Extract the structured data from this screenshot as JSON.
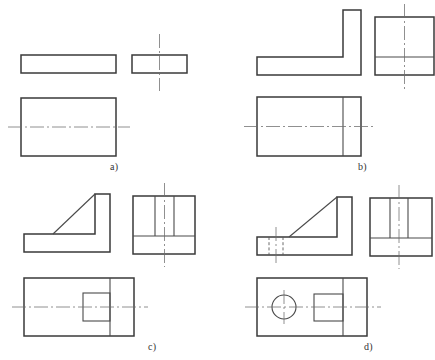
{
  "document": {
    "type": "engineering-drawing",
    "description": "Orthographic projection exercise sheet with four parts",
    "background_color": "#ffffff",
    "line_color": "#3a3a3a",
    "center_line_color": "#6b6b6b",
    "hidden_line_color": "#5a5a5a"
  },
  "figures": [
    {
      "id": "a",
      "label": "a)",
      "title": "Flat rectangular plate",
      "views": [
        {
          "name": "front-view",
          "shape": "rectangle",
          "features": [
            "outline"
          ],
          "center_lines": []
        },
        {
          "name": "side-view",
          "shape": "rectangle",
          "features": [
            "outline"
          ],
          "center_lines": [
            "vertical"
          ]
        },
        {
          "name": "top-view",
          "shape": "rectangle",
          "features": [
            "outline"
          ],
          "center_lines": [
            "horizontal"
          ]
        }
      ]
    },
    {
      "id": "b",
      "label": "b)",
      "title": "L-shaped angle bracket",
      "views": [
        {
          "name": "front-view",
          "shape": "L-profile",
          "features": [
            "outline",
            "vertical-wall-right",
            "horizontal-base"
          ],
          "center_lines": []
        },
        {
          "name": "side-view",
          "shape": "square",
          "features": [
            "outline",
            "horizontal-division-line"
          ],
          "center_lines": [
            "vertical"
          ]
        },
        {
          "name": "top-view",
          "shape": "rectangle",
          "features": [
            "outline",
            "vertical-division-line"
          ],
          "center_lines": [
            "horizontal"
          ]
        }
      ]
    },
    {
      "id": "c",
      "label": "c)",
      "title": "L-bracket with triangular gusset rib",
      "views": [
        {
          "name": "front-view",
          "shape": "L-profile-with-rib",
          "features": [
            "outline",
            "diagonal-rib-edge",
            "vertical-wall-right",
            "horizontal-base"
          ],
          "center_lines": []
        },
        {
          "name": "side-view",
          "shape": "square",
          "features": [
            "outline",
            "rib-edge-left",
            "rib-edge-right",
            "horizontal-division-line"
          ],
          "center_lines": [
            "vertical"
          ]
        },
        {
          "name": "top-view",
          "shape": "rectangle",
          "features": [
            "outline",
            "vertical-division-line",
            "rib-rectangle"
          ],
          "center_lines": [
            "horizontal"
          ]
        }
      ]
    },
    {
      "id": "d",
      "label": "d)",
      "title": "L-bracket with rib and through hole",
      "views": [
        {
          "name": "front-view",
          "shape": "L-profile-with-rib",
          "features": [
            "outline",
            "diagonal-rib-edge",
            "vertical-wall-right",
            "horizontal-base",
            "hidden-hole-lines"
          ],
          "center_lines": [
            "vertical-hole-axis"
          ]
        },
        {
          "name": "side-view",
          "shape": "square",
          "features": [
            "outline",
            "rib-edge-left",
            "rib-edge-right",
            "horizontal-division-line"
          ],
          "center_lines": [
            "vertical-hole-axis"
          ]
        },
        {
          "name": "top-view",
          "shape": "rectangle",
          "features": [
            "outline",
            "vertical-division-line",
            "rib-rectangle",
            "circular-hole"
          ],
          "center_lines": [
            "horizontal",
            "vertical-through-hole"
          ]
        }
      ]
    }
  ]
}
